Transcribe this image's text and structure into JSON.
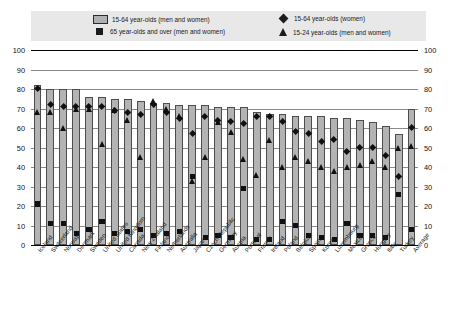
{
  "legend": {
    "items": [
      {
        "key": "bar",
        "icon": "legend-box-swatch",
        "label": "15-64 year-olds (men and women)"
      },
      {
        "key": "square",
        "icon": "legend-square-swatch",
        "label": "65 year-olds and over (men and women)"
      },
      {
        "key": "diamond",
        "icon": "legend-diamond-swatch",
        "label": "15-64 year-olds (women)"
      },
      {
        "key": "triangle",
        "icon": "legend-triangle-swatch",
        "label": "15-24 year-olds (men and women)"
      }
    ],
    "background_color": "#e8e8e8"
  },
  "axis": {
    "ticks": [
      "100",
      "90",
      "80",
      "70",
      "60",
      "50",
      "40",
      "30",
      "20",
      "10",
      "0"
    ],
    "min": 0,
    "max": 100
  },
  "colors": {
    "bar_fill": "#b3b3b3",
    "bar_border": "#4d4d4d",
    "marker": "#101010",
    "gridline": "#8a8a8a",
    "legend_bg": "#e8e8e8"
  },
  "chart_data": {
    "type": "bar",
    "title": "",
    "xlabel": "",
    "ylabel": "",
    "ylim": [
      0,
      100
    ],
    "grid": true,
    "legend_position": "top",
    "categories": [
      "Iceland",
      "Switzerland",
      "Norway",
      "Denmark",
      "Sweden",
      "United States",
      "United Kingdom",
      "Canada",
      "New Zealand",
      "Finland",
      "Netherlands",
      "Australia",
      "Japan",
      "Czech Republic",
      "Germany",
      "Austria",
      "Portugal",
      "France",
      "Ireland",
      "Poland",
      "Belgium",
      "Spain",
      "Korea",
      "Luxembourg",
      "Mexico",
      "Greece",
      "Hungary",
      "Italy",
      "Turkey",
      "Average"
    ],
    "series": [
      {
        "name": "15-64 year-olds (men and women)",
        "marker": "bar",
        "values": [
          82,
          80,
          80,
          80,
          76,
          76,
          75,
          75,
          74,
          73,
          73,
          72,
          72,
          72,
          71,
          71,
          71,
          68,
          67,
          67,
          66,
          66,
          66,
          65,
          65,
          64,
          63,
          61,
          57,
          70
        ]
      },
      {
        "name": "65 year-olds and over (men and women)",
        "marker": "square",
        "values": [
          21,
          11,
          11,
          6,
          8,
          12,
          6,
          7,
          8,
          5,
          6,
          7,
          35,
          4,
          5,
          4,
          29,
          3,
          3,
          12,
          10,
          5,
          4,
          3,
          11,
          5,
          5,
          4,
          26,
          8
        ]
      },
      {
        "name": "15-64 year-olds (women)",
        "marker": "diamond",
        "values": [
          80,
          72,
          71,
          71,
          71,
          71,
          69,
          68,
          67,
          72,
          68,
          65,
          57,
          66,
          64,
          63,
          62,
          66,
          66,
          63,
          58,
          57,
          53,
          54,
          48,
          50,
          50,
          46,
          35,
          60
        ]
      },
      {
        "name": "15-24 year-olds (men and women)",
        "marker": "triangle",
        "values": [
          68,
          68,
          60,
          70,
          70,
          52,
          69,
          64,
          45,
          74,
          70,
          66,
          33,
          45,
          63,
          58,
          44,
          36,
          54,
          40,
          45,
          43,
          40,
          38,
          40,
          41,
          43,
          40,
          50,
          51
        ]
      }
    ]
  }
}
